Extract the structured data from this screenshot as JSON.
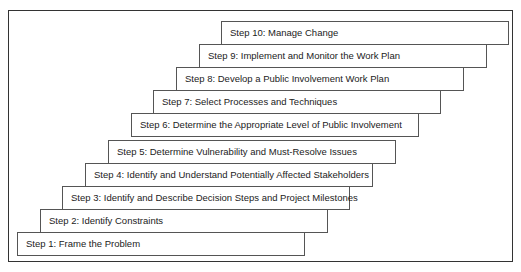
{
  "diagram": {
    "title": "",
    "steps": [
      {
        "label": "Step 1: Frame the Problem"
      },
      {
        "label": "Step 2: Identify Constraints"
      },
      {
        "label": "Step 3: Identify and Describe Decision Steps and Project Milestones"
      },
      {
        "label": "Step 4: Identify and Understand Potentially Affected Stakeholders"
      },
      {
        "label": "Step 5: Determine Vulnerability and Must-Resolve Issues"
      },
      {
        "label": "Step 6: Determine the Appropriate Level of Public Involvement"
      },
      {
        "label": "Step 7: Select Processes and Techniques"
      },
      {
        "label": "Step 8: Develop a Public Involvement Work Plan"
      },
      {
        "label": "Step 9: Implement and Monitor the Work Plan"
      },
      {
        "label": "Step 10: Manage Change"
      }
    ]
  }
}
